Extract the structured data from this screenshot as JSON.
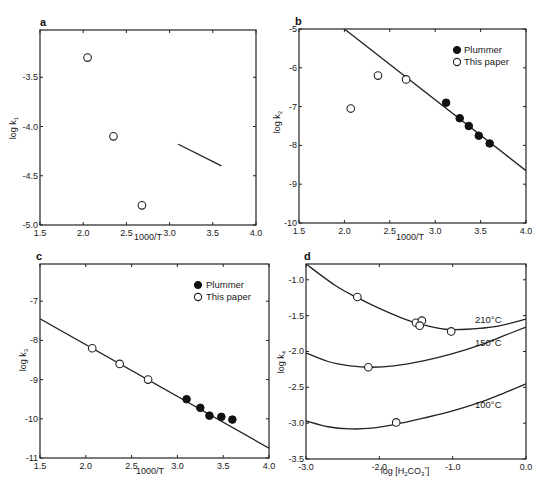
{
  "chart_data": [
    {
      "panel": "a",
      "type": "scatter",
      "xlabel": "1000/T",
      "ylabel": "log k1",
      "xlim": [
        1.5,
        4.0
      ],
      "ylim": [
        -5.0,
        -3.0
      ],
      "xticks": [
        "1.5",
        "2.0",
        "2.5",
        "3.0",
        "3.5",
        "4.0"
      ],
      "yticks": [
        "-3.5",
        "-4.0",
        "-4.5",
        "-5.0"
      ],
      "grid": false,
      "series": [
        {
          "name": "This paper",
          "marker": "open-circle",
          "points": [
            [
              2.05,
              -3.3
            ],
            [
              2.35,
              -4.1
            ],
            [
              2.68,
              -4.8
            ]
          ]
        },
        {
          "name": "line",
          "marker": "line",
          "points": [
            [
              3.1,
              -4.18
            ],
            [
              3.6,
              -4.4
            ]
          ]
        }
      ]
    },
    {
      "panel": "b",
      "type": "scatter",
      "xlabel": "1000/T",
      "ylabel": "log k2",
      "xlim": [
        1.5,
        4.0
      ],
      "ylim": [
        -10,
        -5
      ],
      "xticks": [
        "1.5",
        "2.0",
        "2.5",
        "3.0",
        "3.5",
        "4.0"
      ],
      "yticks": [
        "-5",
        "-6",
        "-7",
        "-8",
        "-9",
        "-10"
      ],
      "grid": false,
      "legend": [
        "Plummer",
        "This paper"
      ],
      "legend_position": "upper right",
      "series": [
        {
          "name": "Plummer",
          "marker": "filled-circle",
          "points": [
            [
              3.12,
              -6.9
            ],
            [
              3.27,
              -7.3
            ],
            [
              3.37,
              -7.5
            ],
            [
              3.48,
              -7.75
            ],
            [
              3.6,
              -7.95
            ]
          ]
        },
        {
          "name": "This paper",
          "marker": "open-circle",
          "points": [
            [
              2.07,
              -7.05
            ],
            [
              2.37,
              -6.2
            ],
            [
              2.68,
              -6.3
            ]
          ]
        },
        {
          "name": "fit",
          "marker": "line",
          "points": [
            [
              2.0,
              -5.0
            ],
            [
              4.0,
              -8.65
            ]
          ]
        }
      ]
    },
    {
      "panel": "c",
      "type": "scatter",
      "xlabel": "1000/T",
      "ylabel": "log k3",
      "xlim": [
        1.5,
        4.0
      ],
      "ylim": [
        -11,
        -6.05
      ],
      "xticks": [
        "1.5",
        "2.0",
        "2.5",
        "3.0",
        "3.5",
        "4.0"
      ],
      "yticks": [
        "-7",
        "-8",
        "-9",
        "-10",
        "-11"
      ],
      "grid": false,
      "legend": [
        "Plummer",
        "This paper"
      ],
      "legend_position": "upper right",
      "series": [
        {
          "name": "Plummer",
          "marker": "filled-circle",
          "points": [
            [
              3.1,
              -9.5
            ],
            [
              3.25,
              -9.72
            ],
            [
              3.35,
              -9.92
            ],
            [
              3.48,
              -9.95
            ],
            [
              3.6,
              -10.02
            ]
          ]
        },
        {
          "name": "This paper",
          "marker": "open-circle",
          "points": [
            [
              2.07,
              -8.2
            ],
            [
              2.37,
              -8.6
            ],
            [
              2.68,
              -9.0
            ]
          ]
        },
        {
          "name": "fit",
          "marker": "line",
          "points": [
            [
              1.5,
              -7.45
            ],
            [
              4.0,
              -10.75
            ]
          ]
        }
      ]
    },
    {
      "panel": "d",
      "type": "line",
      "xlabel": "log [H2CO3*]",
      "ylabel": "log k4",
      "xlim": [
        -3.0,
        0.0
      ],
      "ylim": [
        -3.5,
        -0.78
      ],
      "xticks": [
        "-3.0",
        "-2.0",
        "-1.0",
        "0.0"
      ],
      "yticks": [
        "-1.0",
        "-1.5",
        "-2.0",
        "-2.5",
        "-3.0",
        "-3.5"
      ],
      "grid": false,
      "series": [
        {
          "name": "210°C",
          "marker": "line",
          "points": [
            [
              -3.0,
              -0.78
            ],
            [
              -2.6,
              -1.08
            ],
            [
              -2.3,
              -1.25
            ],
            [
              -2.0,
              -1.4
            ],
            [
              -1.7,
              -1.53
            ],
            [
              -1.4,
              -1.63
            ],
            [
              -1.1,
              -1.69
            ],
            [
              -0.8,
              -1.69
            ],
            [
              -0.4,
              -1.65
            ],
            [
              0.0,
              -1.55
            ]
          ],
          "data_points": [
            [
              -2.3,
              -1.24
            ],
            [
              -1.5,
              -1.6
            ],
            [
              -1.42,
              -1.57
            ],
            [
              -1.45,
              -1.64
            ],
            [
              -1.02,
              -1.72
            ]
          ]
        },
        {
          "name": "150°C",
          "marker": "line",
          "points": [
            [
              -3.0,
              -2.02
            ],
            [
              -2.7,
              -2.14
            ],
            [
              -2.4,
              -2.2
            ],
            [
              -2.1,
              -2.22
            ],
            [
              -1.8,
              -2.2
            ],
            [
              -1.4,
              -2.13
            ],
            [
              -1.0,
              -2.03
            ],
            [
              -0.6,
              -1.9
            ],
            [
              -0.3,
              -1.78
            ],
            [
              0.0,
              -1.66
            ]
          ],
          "data_points": [
            [
              -2.15,
              -2.22
            ]
          ]
        },
        {
          "name": "100°C",
          "marker": "line",
          "points": [
            [
              -3.0,
              -2.97
            ],
            [
              -2.7,
              -3.05
            ],
            [
              -2.4,
              -3.08
            ],
            [
              -2.1,
              -3.07
            ],
            [
              -1.8,
              -3.02
            ],
            [
              -1.4,
              -2.93
            ],
            [
              -1.0,
              -2.83
            ],
            [
              -0.6,
              -2.7
            ],
            [
              -0.3,
              -2.58
            ],
            [
              0.0,
              -2.45
            ]
          ],
          "data_points": [
            [
              -1.77,
              -2.99
            ]
          ]
        }
      ],
      "annotations": [
        {
          "text": "210°C",
          "x": -0.55,
          "y": -1.62
        },
        {
          "text": "150°C",
          "x": -0.55,
          "y": -1.95
        },
        {
          "text": "100°C",
          "x": -0.55,
          "y": -2.8
        }
      ]
    }
  ],
  "panels": {
    "a": {
      "letter": "a",
      "xlabel": "1000/T",
      "ylabel_main": "log k",
      "ylabel_sub": "1"
    },
    "b": {
      "letter": "b",
      "xlabel": "1000/T",
      "ylabel_main": "log k",
      "ylabel_sub": "2",
      "legend_filled": "Plummer",
      "legend_open": "This paper"
    },
    "c": {
      "letter": "c",
      "xlabel": "1000/T",
      "ylabel_main": "log k",
      "ylabel_sub": "3",
      "legend_filled": "Plummer",
      "legend_open": "This paper"
    },
    "d": {
      "letter": "d",
      "xlabel_main": "log [H",
      "xlabel_sub": "2",
      "xlabel_mid": "CO",
      "xlabel_sub2": "3",
      "xlabel_sup": "*",
      "xlabel_end": "]",
      "ylabel_main": "log k",
      "ylabel_sub": "4",
      "temp_210": "210°C",
      "temp_150": "150°C",
      "temp_100": "100°C"
    }
  }
}
